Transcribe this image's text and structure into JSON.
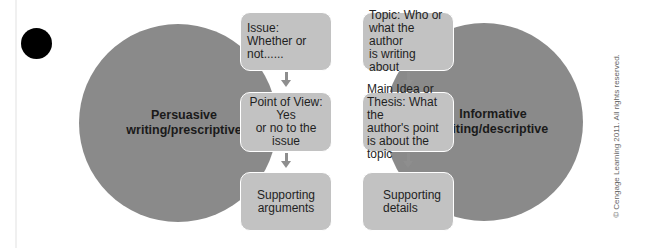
{
  "diagram": {
    "left_circle": {
      "label": "Persuasive\nwriting/prescriptive",
      "color": "#8a8a8a"
    },
    "right_circle": {
      "label": "Informative\nwriting/descriptive",
      "color": "#8a8a8a"
    },
    "left_column": [
      {
        "text": "Issue: Whether or\nnot......"
      },
      {
        "text": "Point of View: Yes\nor no to the issue"
      },
      {
        "text": "Supporting\narguments"
      }
    ],
    "right_column": [
      {
        "text": "Topic: Who or\nwhat the author\nis writing about"
      },
      {
        "text": "Main Idea or\nThesis: What the\nauthor's point\nis about the topic"
      },
      {
        "text": "Supporting\ndetails"
      }
    ],
    "box_color": "#c2c2c2",
    "arrow_color": "#8e8e8e"
  },
  "copyright": "© Cengage Learning 2011. All rights reserved."
}
